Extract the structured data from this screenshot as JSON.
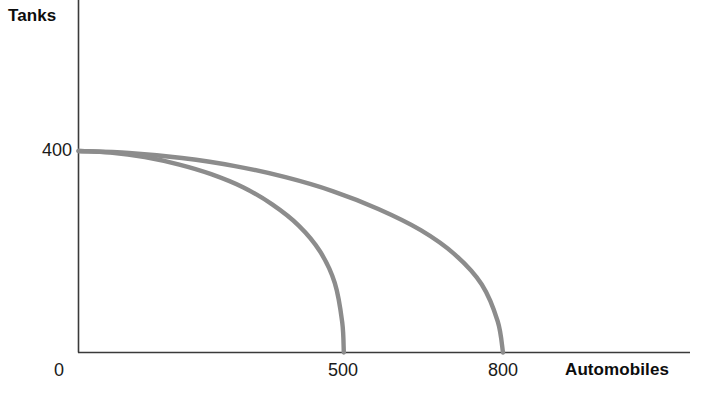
{
  "chart_data": {
    "type": "line",
    "title": "",
    "subtitle": "",
    "xlabel": "Automobiles",
    "ylabel": "Tanks",
    "xlim": [
      0,
      1000
    ],
    "ylim": [
      0,
      520
    ],
    "grid": false,
    "legend": null,
    "x_ticks": [
      {
        "value": 0,
        "label": "0"
      },
      {
        "value": 500,
        "label": "500"
      },
      {
        "value": 800,
        "label": "800"
      }
    ],
    "y_ticks": [
      {
        "value": 400,
        "label": "400"
      }
    ],
    "series": [
      {
        "name": "inner-frontier",
        "description": "Production possibility frontier, smaller capacity",
        "color": "#8c8c8c",
        "x_intercept": 500,
        "y_intercept": 400,
        "points": [
          {
            "x": 0,
            "y": 400
          },
          {
            "x": 60,
            "y": 397
          },
          {
            "x": 125,
            "y": 388
          },
          {
            "x": 190,
            "y": 373
          },
          {
            "x": 250,
            "y": 354
          },
          {
            "x": 310,
            "y": 328
          },
          {
            "x": 365,
            "y": 294
          },
          {
            "x": 415,
            "y": 252
          },
          {
            "x": 455,
            "y": 201
          },
          {
            "x": 483,
            "y": 138
          },
          {
            "x": 497,
            "y": 60
          },
          {
            "x": 500,
            "y": 0
          }
        ]
      },
      {
        "name": "outer-frontier",
        "description": "Production possibility frontier, expanded capacity",
        "color": "#8c8c8c",
        "x_intercept": 800,
        "y_intercept": 400,
        "points": [
          {
            "x": 0,
            "y": 400
          },
          {
            "x": 95,
            "y": 396
          },
          {
            "x": 195,
            "y": 386
          },
          {
            "x": 295,
            "y": 370
          },
          {
            "x": 390,
            "y": 348
          },
          {
            "x": 480,
            "y": 320
          },
          {
            "x": 565,
            "y": 285
          },
          {
            "x": 645,
            "y": 243
          },
          {
            "x": 710,
            "y": 194
          },
          {
            "x": 760,
            "y": 135
          },
          {
            "x": 790,
            "y": 62
          },
          {
            "x": 800,
            "y": 0
          }
        ]
      }
    ]
  },
  "axes": {
    "y_axis_title": "Tanks",
    "x_axis_title": "Automobiles",
    "origin_label": "0",
    "y_tick_400": "400",
    "x_tick_500": "500",
    "x_tick_800": "800"
  },
  "colors": {
    "curve": "#8c8c8c",
    "axis": "#3a3a3a",
    "text": "#0d0d0d",
    "background": "#ffffff"
  }
}
